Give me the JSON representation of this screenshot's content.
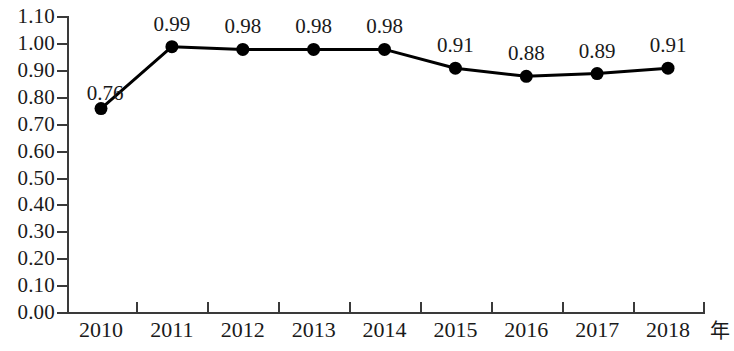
{
  "chart_data": {
    "type": "line",
    "title": "",
    "xlabel": "年",
    "ylabel": "",
    "categories": [
      "2010",
      "2011",
      "2012",
      "2013",
      "2014",
      "2015",
      "2016",
      "2017",
      "2018"
    ],
    "values": [
      0.76,
      0.99,
      0.98,
      0.98,
      0.98,
      0.91,
      0.88,
      0.89,
      0.91
    ],
    "point_labels": [
      "0.76",
      "0.99",
      "0.98",
      "0.98",
      "0.98",
      "0.91",
      "0.88",
      "0.89",
      "0.91"
    ],
    "ylim": [
      0.0,
      1.1
    ],
    "ytick_labels": [
      "1.10",
      "1.00",
      "0.90",
      "0.80",
      "0.70",
      "0.60",
      "0.50",
      "0.40",
      "0.30",
      "0.20",
      "0.10",
      "0.00"
    ],
    "ytick_values": [
      1.1,
      1.0,
      0.9,
      0.8,
      0.7,
      0.6,
      0.5,
      0.4,
      0.3,
      0.2,
      0.1,
      0.0
    ],
    "grid": false,
    "legend": null,
    "series_color": "#000000",
    "marker": "circle",
    "axis_color": "#3a3a3a"
  }
}
